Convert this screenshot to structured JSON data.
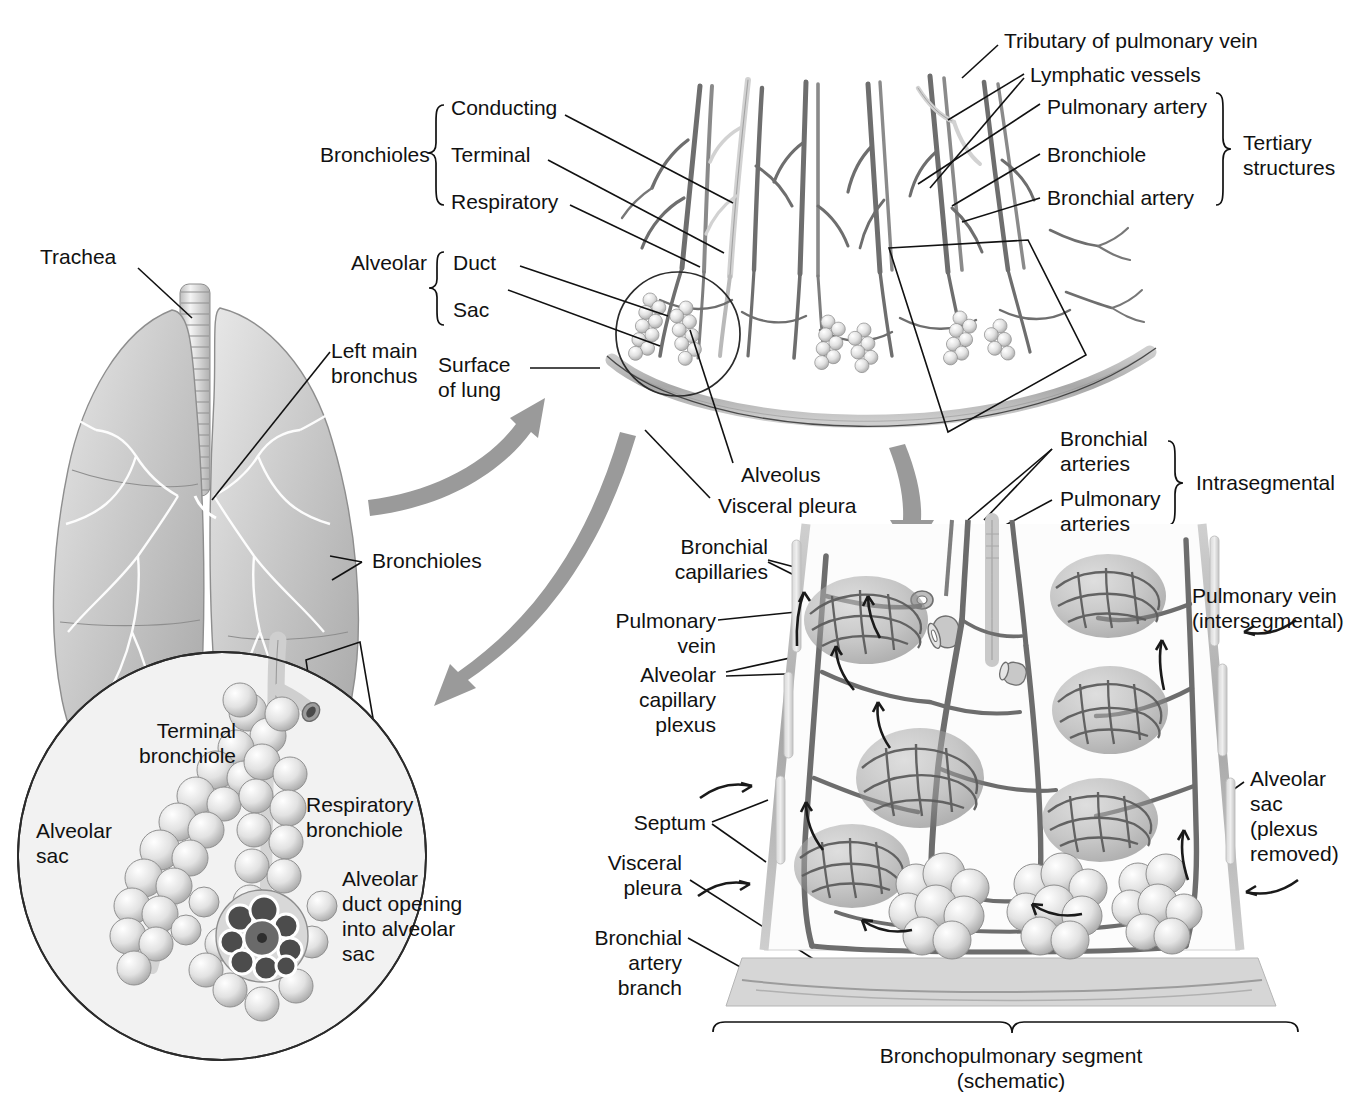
{
  "figure": {
    "background_color": "#ffffff",
    "ink_color": "#111111",
    "arrow_color": "#9a9a9a",
    "inset_fill": "#f2f2f2"
  },
  "panels": {
    "lungs": {
      "name": "Trachea and lungs overview"
    },
    "tertiary": {
      "name": "Tertiary (segmental) structures fan"
    },
    "inset": {
      "name": "Terminal bronchiole / alveolar sac magnification"
    },
    "segment": {
      "name": "Bronchopulmonary segment (schematic)"
    }
  },
  "labels": {
    "trachea": "Trachea",
    "left_main_bronchus": "Left main\nbronchus",
    "bronchioles_lung": "Bronchioles",
    "bronchioles_group": "Bronchioles",
    "conducting": "Conducting",
    "terminal": "Terminal",
    "respiratory": "Respiratory",
    "alveolar_group": "Alveolar",
    "duct": "Duct",
    "sac": "Sac",
    "surface_of_lung": "Surface\nof lung",
    "tributary_pulmonary_vein": "Tributary of pulmonary vein",
    "lymphatic_vessels": "Lymphatic vessels",
    "pulmonary_artery": "Pulmonary artery",
    "bronchiole": "Bronchiole",
    "bronchial_artery": "Bronchial artery",
    "tertiary_structures": "Tertiary\nstructures",
    "alveolus": "Alveolus",
    "visceral_pleura_top": "Visceral pleura",
    "bronchial_arteries": "Bronchial\narteries",
    "pulmonary_arteries": "Pulmonary\narteries",
    "intrasegmental": "Intrasegmental",
    "bronchial_capillaries": "Bronchial\ncapillaries",
    "pulmonary_vein": "Pulmonary\nvein",
    "alveolar_capillary_plexus": "Alveolar\ncapillary\nplexus",
    "septum": "Septum",
    "visceral_pleura_bottom": "Visceral\npleura",
    "bronchial_artery_branch": "Bronchial\nartery\nbranch",
    "pulmonary_vein_intersegmental": "Pulmonary vein\n(intersegmental)",
    "alveolar_sac_plexus_removed": "Alveolar\nsac\n(plexus\nremoved)",
    "bronchopulmonary_segment_caption": "Bronchopulmonary segment\n(schematic)",
    "terminal_bronchiole": "Terminal\nbronchiole",
    "respiratory_bronchiole": "Respiratory\nbronchiole",
    "alveolar_sac": "Alveolar\nsac",
    "alveolar_duct_opening": "Alveolar\nduct opening\ninto alveolar\nsac"
  },
  "braces": {
    "bronchioles": {
      "label": "Bronchioles",
      "members": [
        "Conducting",
        "Terminal",
        "Respiratory"
      ]
    },
    "alveolar": {
      "label": "Alveolar",
      "members": [
        "Duct",
        "Sac"
      ]
    },
    "tertiary": {
      "label": "Tertiary structures",
      "members": [
        "Pulmonary artery",
        "Bronchiole",
        "Bronchial artery"
      ]
    },
    "intrasegmental": {
      "label": "Intrasegmental",
      "members": [
        "Bronchial arteries",
        "Pulmonary arteries"
      ]
    },
    "segment": {
      "label": "Bronchopulmonary segment (schematic)",
      "members": []
    }
  }
}
